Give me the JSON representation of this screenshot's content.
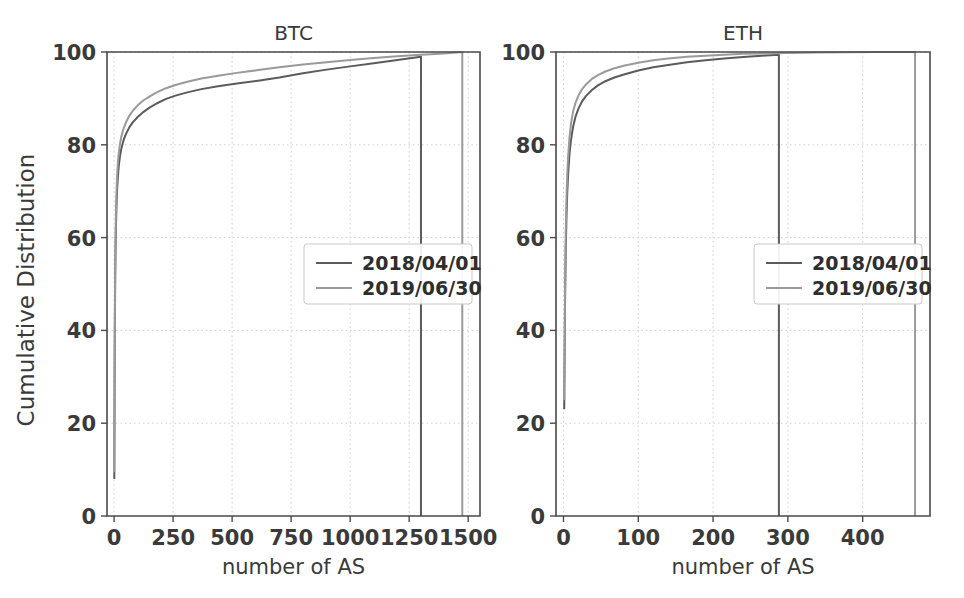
{
  "figure": {
    "width": 964,
    "height": 598,
    "background": "#ffffff"
  },
  "series_styles": [
    {
      "name": "2018/04/01",
      "color": "#5b5b5b",
      "width": 2.0
    },
    {
      "name": "2019/06/30",
      "color": "#9a9a9a",
      "width": 2.0
    }
  ],
  "legend": {
    "position": "center-right",
    "entries": [
      "2018/04/01",
      "2019/06/30"
    ]
  },
  "axis_common": {
    "ylabel": "Cumulative Distribution",
    "xlabel": "number of AS",
    "yticks": [
      0,
      20,
      40,
      60,
      80,
      100
    ],
    "ylim": [
      0,
      100
    ],
    "grid": true
  },
  "chart_data": [
    {
      "type": "line",
      "title": "BTC",
      "xlabel": "number of AS",
      "ylabel": "Cumulative Distribution",
      "xlim": [
        -30,
        1550
      ],
      "ylim": [
        0,
        100
      ],
      "xticks": [
        0,
        250,
        500,
        750,
        1000,
        1250,
        1500
      ],
      "yticks": [
        0,
        20,
        40,
        60,
        80,
        100
      ],
      "grid": true,
      "legend_position": "center-right",
      "series": [
        {
          "name": "2018/04/01",
          "color": "#5b5b5b",
          "x": [
            1,
            2,
            3,
            4,
            5,
            6,
            8,
            10,
            13,
            16,
            20,
            25,
            30,
            40,
            50,
            65,
            80,
            100,
            125,
            150,
            180,
            220,
            260,
            310,
            370,
            440,
            520,
            610,
            700,
            800,
            900,
            1000,
            1100,
            1200,
            1300,
            1300
          ],
          "y": [
            8.0,
            25.0,
            38.0,
            46.0,
            52.0,
            56.5,
            62.5,
            66.5,
            70.5,
            73.0,
            75.5,
            77.5,
            79.0,
            81.0,
            82.3,
            83.8,
            84.9,
            86.0,
            87.1,
            88.0,
            88.9,
            89.9,
            90.6,
            91.3,
            92.0,
            92.6,
            93.2,
            93.8,
            94.5,
            95.4,
            96.2,
            96.9,
            97.6,
            98.3,
            99.0,
            0.0
          ]
        },
        {
          "name": "2019/06/30",
          "color": "#9a9a9a",
          "x": [
            1,
            2,
            3,
            4,
            5,
            6,
            8,
            10,
            13,
            16,
            20,
            25,
            30,
            40,
            50,
            65,
            80,
            100,
            125,
            150,
            180,
            220,
            260,
            310,
            370,
            440,
            520,
            610,
            700,
            800,
            900,
            1000,
            1100,
            1200,
            1300,
            1400,
            1475,
            1475
          ],
          "y": [
            9.5,
            28.0,
            41.0,
            49.5,
            55.5,
            60.0,
            65.5,
            69.5,
            73.5,
            76.0,
            78.3,
            80.2,
            81.6,
            83.5,
            84.8,
            86.3,
            87.4,
            88.5,
            89.6,
            90.4,
            91.3,
            92.2,
            92.9,
            93.6,
            94.3,
            94.9,
            95.5,
            96.1,
            96.7,
            97.3,
            97.8,
            98.3,
            98.7,
            99.1,
            99.4,
            99.7,
            100.0,
            0.0
          ]
        }
      ]
    },
    {
      "type": "line",
      "title": "ETH",
      "xlabel": "number of AS",
      "ylabel": "Cumulative Distribution",
      "xlim": [
        -10,
        490
      ],
      "ylim": [
        0,
        100
      ],
      "xticks": [
        0,
        100,
        200,
        300,
        400
      ],
      "yticks": [
        0,
        20,
        40,
        60,
        80,
        100
      ],
      "grid": true,
      "legend_position": "center-right",
      "series": [
        {
          "name": "2018/04/01",
          "color": "#5b5b5b",
          "x": [
            1,
            2,
            3,
            4,
            5,
            6,
            8,
            10,
            13,
            16,
            20,
            25,
            30,
            38,
            46,
            56,
            68,
            82,
            100,
            120,
            140,
            165,
            190,
            215,
            240,
            265,
            288,
            288
          ],
          "y": [
            23.0,
            45.0,
            57.0,
            64.5,
            69.5,
            73.0,
            78.0,
            81.0,
            84.0,
            86.0,
            87.8,
            89.4,
            90.5,
            91.8,
            92.8,
            93.7,
            94.5,
            95.2,
            96.0,
            96.7,
            97.2,
            97.8,
            98.2,
            98.6,
            98.9,
            99.2,
            99.4,
            0.0
          ]
        },
        {
          "name": "2019/06/30",
          "color": "#9a9a9a",
          "x": [
            1,
            2,
            3,
            4,
            5,
            6,
            8,
            10,
            13,
            16,
            20,
            25,
            30,
            38,
            46,
            56,
            68,
            82,
            100,
            120,
            140,
            165,
            190,
            215,
            240,
            270,
            300,
            340,
            380,
            420,
            470,
            470
          ],
          "y": [
            25.0,
            48.0,
            61.0,
            68.5,
            73.5,
            77.0,
            81.5,
            84.5,
            87.3,
            89.0,
            90.6,
            92.0,
            93.0,
            94.2,
            95.0,
            95.8,
            96.5,
            97.1,
            97.7,
            98.2,
            98.6,
            99.0,
            99.2,
            99.4,
            99.6,
            99.7,
            99.8,
            99.9,
            99.95,
            99.98,
            100.0,
            0.0
          ]
        }
      ]
    }
  ]
}
